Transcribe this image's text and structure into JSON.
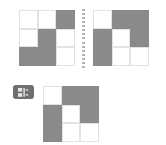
{
  "diagram": {
    "background_color": "#ffffff",
    "filled_color": "#8a8a8a",
    "empty_color": "#ffffff",
    "cell_border_color": "#e2e2e2",
    "divider": {
      "name": "dotted-divider",
      "orientation": "vertical",
      "style": "dotted",
      "color": "#b4b4b4",
      "dot_count": 15
    },
    "badge": {
      "label": "",
      "icon": "flip-horizontal-icon",
      "background_color": "#6f6f6f",
      "glyph_color": "#e8e8e8"
    },
    "panels": [
      {
        "name": "input-grid-left",
        "rows": 3,
        "cols": 3,
        "cells": [
          [
            0,
            0,
            1
          ],
          [
            0,
            1,
            0
          ],
          [
            1,
            1,
            0
          ]
        ]
      },
      {
        "name": "input-grid-right",
        "rows": 3,
        "cols": 3,
        "cells": [
          [
            0,
            1,
            1
          ],
          [
            1,
            0,
            1
          ],
          [
            1,
            0,
            0
          ]
        ]
      },
      {
        "name": "output-grid-result",
        "rows": 3,
        "cols": 3,
        "cells": [
          [
            0,
            1,
            1
          ],
          [
            1,
            0,
            1
          ],
          [
            1,
            0,
            0
          ]
        ]
      }
    ]
  }
}
